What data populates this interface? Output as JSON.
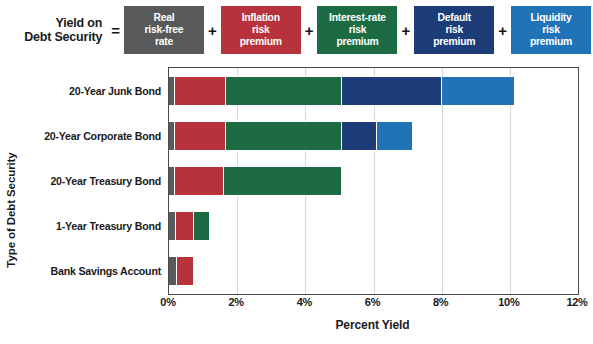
{
  "formula": {
    "lhs_line1": "Yield on",
    "lhs_line2": "Debt Security",
    "equals": "=",
    "plus": "+",
    "terms": [
      {
        "line1": "Real",
        "line2": "risk-free",
        "line3": "rate",
        "color": "#58595b"
      },
      {
        "line1": "Inflation",
        "line2": "risk",
        "line3": "premium",
        "color": "#b7323a"
      },
      {
        "line1": "Interest-rate",
        "line2": "risk",
        "line3": "premium",
        "color": "#1d6b43"
      },
      {
        "line1": "Default",
        "line2": "risk",
        "line3": "premium",
        "color": "#1c3d77"
      },
      {
        "line1": "Liquidity",
        "line2": "risk",
        "line3": "premium",
        "color": "#2173b8"
      }
    ]
  },
  "chart_data": {
    "type": "bar",
    "orientation": "horizontal",
    "stacked": true,
    "title": "",
    "xlabel": "Percent Yield",
    "ylabel": "Type of Debt Security",
    "xlim": [
      0,
      12
    ],
    "xtick_labels": [
      "0%",
      "2%",
      "4%",
      "6%",
      "8%",
      "10%",
      "12%"
    ],
    "xticks": [
      0,
      2,
      4,
      6,
      8,
      10,
      12
    ],
    "grid": true,
    "legend_position": "top",
    "categories": [
      "20-Year Junk Bond",
      "20-Year Corporate Bond",
      "20-Year Treasury Bond",
      "1-Year Treasury Bond",
      "Bank Savings Account"
    ],
    "series": [
      {
        "name": "Real risk-free rate",
        "color": "#58595b",
        "values": [
          0.15,
          0.15,
          0.15,
          0.18,
          0.22
        ]
      },
      {
        "name": "Inflation risk premium",
        "color": "#b7323a",
        "values": [
          1.45,
          1.45,
          1.4,
          0.5,
          0.45
        ]
      },
      {
        "name": "Interest-rate risk premium",
        "color": "#1d6b43",
        "values": [
          3.4,
          3.4,
          3.45,
          0.45,
          0.0
        ]
      },
      {
        "name": "Default risk premium",
        "color": "#1c3d77",
        "values": [
          2.9,
          1.0,
          0.0,
          0.0,
          0.0
        ]
      },
      {
        "name": "Liquidity risk premium",
        "color": "#2173b8",
        "values": [
          2.1,
          1.0,
          0.0,
          0.0,
          0.0
        ]
      }
    ],
    "totals": [
      10.0,
      7.0,
      5.0,
      1.13,
      0.67
    ]
  }
}
